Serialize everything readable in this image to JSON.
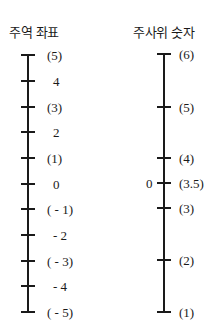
{
  "left_axis": {
    "title": "주역 좌표",
    "ticks": [
      {
        "label": "(5)",
        "y": 55
      },
      {
        "label": "4",
        "y": 81
      },
      {
        "label": "(3)",
        "y": 107
      },
      {
        "label": "2",
        "y": 132
      },
      {
        "label": "(1)",
        "y": 158
      },
      {
        "label": "0",
        "y": 184
      },
      {
        "label": "( - 1)",
        "y": 209
      },
      {
        "label": "- 2",
        "y": 235
      },
      {
        "label": "( - 3)",
        "y": 261
      },
      {
        "label": "- 4",
        "y": 286
      },
      {
        "label": "( - 5)",
        "y": 312
      }
    ]
  },
  "right_axis": {
    "title": "주사위 숫자",
    "side_label": "0",
    "ticks": [
      {
        "label": "(6)",
        "y": 54
      },
      {
        "label": "(5)",
        "y": 107
      },
      {
        "label": "(4)",
        "y": 158
      },
      {
        "label": "(3.5)",
        "y": 183
      },
      {
        "label": "(3)",
        "y": 208
      },
      {
        "label": "(2)",
        "y": 260
      },
      {
        "label": "(1)",
        "y": 312
      }
    ]
  }
}
